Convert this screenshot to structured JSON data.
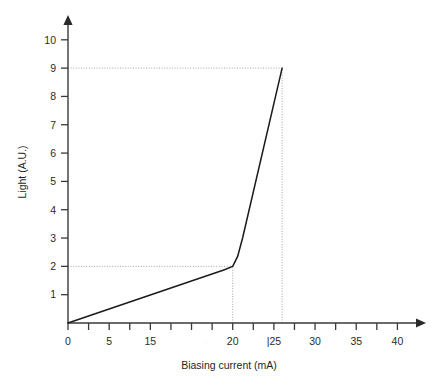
{
  "chart_data": {
    "type": "line",
    "title": "",
    "subtitle": "",
    "xlabel": "Biasing current (mA)",
    "ylabel": "Light (A.U.)",
    "xlim": [
      0,
      42.5
    ],
    "ylim": [
      0,
      10.6
    ],
    "grid": false,
    "legend": null,
    "x_tick_labels": [
      "0",
      "5",
      "15",
      "20",
      "|25",
      "30",
      "35",
      "40"
    ],
    "x_tick_label_values": [
      0,
      5,
      10,
      20,
      25,
      30,
      35,
      40
    ],
    "x_minor_ticks": [
      0,
      2.5,
      5,
      7.5,
      10,
      12.5,
      15,
      17.5,
      20,
      22.5,
      25,
      27.5,
      30,
      32.5,
      35,
      37.5,
      40
    ],
    "y_tick_labels": [
      "1",
      "2",
      "3",
      "4",
      "5",
      "6",
      "7",
      "8",
      "9",
      "10"
    ],
    "y_tick_values": [
      1,
      2,
      3,
      4,
      5,
      6,
      7,
      8,
      9,
      10
    ],
    "series": [
      {
        "name": "Light output vs biasing current",
        "color": "#1a1a1a",
        "points": [
          {
            "x": 0,
            "y": 0
          },
          {
            "x": 19.0,
            "y": 1.88
          },
          {
            "x": 20.0,
            "y": 2.0
          },
          {
            "x": 20.6,
            "y": 2.35
          },
          {
            "x": 21.2,
            "y": 3.0
          },
          {
            "x": 26.0,
            "y": 9.0
          }
        ]
      }
    ],
    "annotations": [
      {
        "name": "threshold-guide-horizontal",
        "type": "dotted-horizontal",
        "y": 2,
        "x_from": 0,
        "x_to": 20
      },
      {
        "name": "threshold-guide-vertical",
        "type": "dotted-vertical",
        "x": 20,
        "y_from": 0,
        "y_to": 2
      },
      {
        "name": "peak-guide-horizontal",
        "type": "dotted-horizontal",
        "y": 9,
        "x_from": 0,
        "x_to": 26
      },
      {
        "name": "peak-guide-vertical",
        "type": "dotted-vertical",
        "x": 26,
        "y_from": 0,
        "y_to": 9
      }
    ],
    "axis_style": {
      "arrow_heads": true,
      "axis_color": "#3a3a3a",
      "guide_color": "#9a9a9a"
    }
  }
}
